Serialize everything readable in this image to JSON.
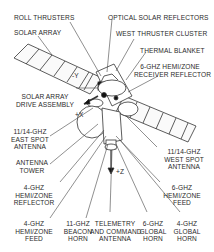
{
  "diagram": {
    "labels": {
      "roll_thrusters": "ROLL THRUSTERS",
      "solar_array": "SOLAR ARRAY",
      "optical_solar_reflectors": "OPTICAL SOLAR REFLECTORS",
      "west_thruster_cluster": "WEST THRUSTER CLUSTER",
      "thermal_blanket": "THERMAL BLANKET",
      "receiver_reflector_l1": "6-GHz HEMI/ZONE",
      "receiver_reflector_l2": "RECEIVER REFLECTOR",
      "drive_assembly_l1": "SOLAR ARRAY",
      "drive_assembly_l2": "DRIVE ASSEMBLY",
      "east_spot_l1": "11/14-GHz",
      "east_spot_l2": "EAST SPOT",
      "east_spot_l3": "ANTENNA",
      "west_spot_l1": "11/14-GHz",
      "west_spot_l2": "WEST SPOT",
      "west_spot_l3": "ANTENNA",
      "antenna_tower_l1": "ANTENNA",
      "antenna_tower_l2": "TOWER",
      "hemi_reflector_4_l1": "4-GHz",
      "hemi_reflector_4_l2": "HEMI/ZONE",
      "hemi_reflector_4_l3": "REFLECTOR",
      "hemi_feed_6_l1": "6-GHZ",
      "hemi_feed_6_l2": "HEMI/ZONE",
      "hemi_feed_6_l3": "FEED",
      "hemi_feed_4_l1": "4-GHz",
      "hemi_feed_4_l2": "HEMI/ZONE",
      "hemi_feed_4_l3": "FEED",
      "beacon_l1": "11-GHz",
      "beacon_l2": "BEACON",
      "beacon_l3": "HORN",
      "telemetry_l1": "TELEMETRY",
      "telemetry_l2": "AND COMMAND",
      "telemetry_l3": "ANTENNA",
      "global_6_l1": "6-GHz",
      "global_6_l2": "GLOBAL",
      "global_6_l3": "HORN",
      "global_4_l1": "4-GHZ",
      "global_4_l2": "GLOBAL",
      "global_4_l3": "HORN"
    },
    "axes": {
      "minus_y": "-Y",
      "plus_x": "+X",
      "plus_z": "+Z"
    }
  }
}
